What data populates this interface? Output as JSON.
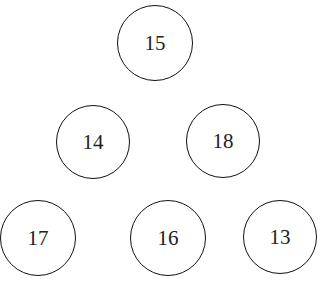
{
  "nodes": [
    {
      "id": "top",
      "label": "15",
      "cx": 155,
      "cy": 43,
      "r": 38
    },
    {
      "id": "mid-left",
      "label": "14",
      "cx": 93,
      "cy": 142,
      "r": 37
    },
    {
      "id": "mid-right",
      "label": "18",
      "cx": 223,
      "cy": 141,
      "r": 37
    },
    {
      "id": "bottom-left",
      "label": "17",
      "cx": 38,
      "cy": 238,
      "r": 38
    },
    {
      "id": "bottom-middle",
      "label": "16",
      "cx": 168,
      "cy": 238,
      "r": 38
    },
    {
      "id": "bottom-right",
      "label": "13",
      "cx": 280,
      "cy": 237,
      "r": 37
    }
  ]
}
